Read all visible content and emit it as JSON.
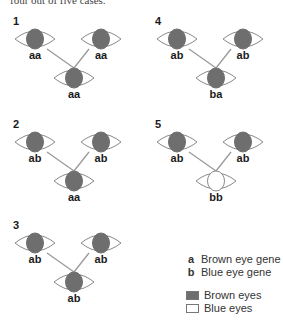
{
  "caption": "four out of five cases.",
  "colors": {
    "brown_iris": "#6e6e6e",
    "blue_iris": "#ffffff",
    "eye_outline": "#8a8a8a",
    "connector": "#9a9a9a"
  },
  "panels": [
    {
      "number": "1",
      "parent_left": {
        "genotype": "aa",
        "phenotype": "brown"
      },
      "parent_right": {
        "genotype": "aa",
        "phenotype": "brown"
      },
      "child": {
        "genotype": "aa",
        "phenotype": "brown"
      }
    },
    {
      "number": "2",
      "parent_left": {
        "genotype": "ab",
        "phenotype": "brown"
      },
      "parent_right": {
        "genotype": "ab",
        "phenotype": "brown"
      },
      "child": {
        "genotype": "aa",
        "phenotype": "brown"
      }
    },
    {
      "number": "3",
      "parent_left": {
        "genotype": "ab",
        "phenotype": "brown"
      },
      "parent_right": {
        "genotype": "ab",
        "phenotype": "brown"
      },
      "child": {
        "genotype": "ab",
        "phenotype": "brown"
      }
    },
    {
      "number": "4",
      "parent_left": {
        "genotype": "ab",
        "phenotype": "brown"
      },
      "parent_right": {
        "genotype": "ab",
        "phenotype": "brown"
      },
      "child": {
        "genotype": "ba",
        "phenotype": "brown"
      }
    },
    {
      "number": "5",
      "parent_left": {
        "genotype": "ab",
        "phenotype": "brown"
      },
      "parent_right": {
        "genotype": "ab",
        "phenotype": "brown"
      },
      "child": {
        "genotype": "bb",
        "phenotype": "blue"
      }
    }
  ],
  "legend": {
    "genes": [
      {
        "key": "a",
        "label": "Brown eye gene"
      },
      {
        "key": "b",
        "label": "Blue eye gene"
      }
    ],
    "phenotypes": [
      {
        "label": "Brown eyes",
        "color": "#6e6e6e"
      },
      {
        "label": "Blue eyes",
        "color": "#ffffff"
      }
    ]
  }
}
